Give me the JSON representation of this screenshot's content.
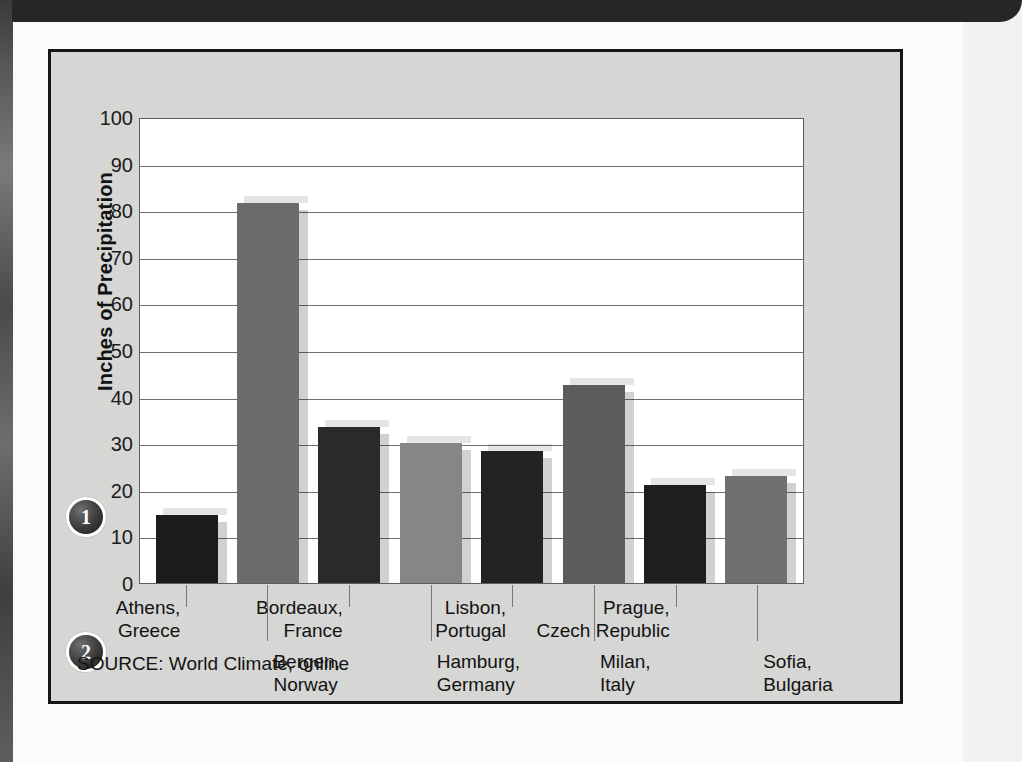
{
  "page": {
    "background_color": "#fbfbfa",
    "panel_background_color": "#d6d6d4",
    "banner_color": "#262626"
  },
  "annotations": {
    "badge_1": "1",
    "badge_2": "2"
  },
  "source": {
    "prefix": "SOURCE:",
    "title": "World Climate",
    "suffix": ", online"
  },
  "chart_data": {
    "type": "bar",
    "title": "",
    "xlabel": "",
    "ylabel": "Inches of Precipitation",
    "ylim": [
      0,
      100
    ],
    "yticks": [
      100,
      90,
      80,
      70,
      60,
      50,
      40,
      30,
      20,
      10,
      0
    ],
    "grid": true,
    "legend": "none",
    "categories": [
      "Athens,\nGreece",
      "Bergen,\nNorway",
      "Bordeaux,\nFrance",
      "Hamburg,\nGermany",
      "Lisbon,\nPortugal",
      "Milan,\nItaly",
      "Prague,\nCzech Republic",
      "Sofia,\nBulgaria"
    ],
    "category_lines": [
      [
        "Athens,",
        "Greece"
      ],
      [
        "Bergen,",
        "Norway"
      ],
      [
        "Bordeaux,",
        "France"
      ],
      [
        "Hamburg,",
        "Germany"
      ],
      [
        "Lisbon,",
        "Portugal"
      ],
      [
        "Milan,",
        "Italy"
      ],
      [
        "Prague,",
        "Czech Republic"
      ],
      [
        "Sofia,",
        "Bulgaria"
      ]
    ],
    "values": [
      14.5,
      81.5,
      33.5,
      30,
      28.3,
      42.5,
      21,
      23
    ],
    "bar_colors": [
      "#1c1c1c",
      "#6b6b6b",
      "#2a2a2a",
      "#868686",
      "#232323",
      "#5c5c5c",
      "#1e1e1e",
      "#707070"
    ]
  }
}
